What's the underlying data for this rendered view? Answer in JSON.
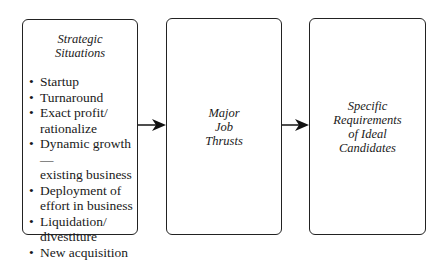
{
  "diagram": {
    "boxes": [
      {
        "title_lines": [
          "Strategic",
          "Situations"
        ],
        "items": [
          [
            "Startup"
          ],
          [
            "Turnaround"
          ],
          [
            "Exact profit/",
            "rationalize"
          ],
          [
            "Dynamic growth—",
            "existing business"
          ],
          [
            "Deployment of",
            "effort in business"
          ],
          [
            "Liquidation/",
            "divestiture"
          ],
          [
            "New acquisition"
          ]
        ]
      },
      {
        "title_lines": [
          "Major",
          "Job",
          "Thrusts"
        ]
      },
      {
        "title_lines": [
          "Specific",
          "Requirements",
          "of Ideal",
          "Candidates"
        ]
      }
    ],
    "arrows": [
      {
        "from": "Strategic Situations",
        "to": "Major Job Thrusts"
      },
      {
        "from": "Major Job Thrusts",
        "to": "Specific Requirements of Ideal Candidates"
      }
    ],
    "colors": {
      "stroke": "#222222",
      "background": "#ffffff",
      "text": "#1a1a1a"
    }
  }
}
